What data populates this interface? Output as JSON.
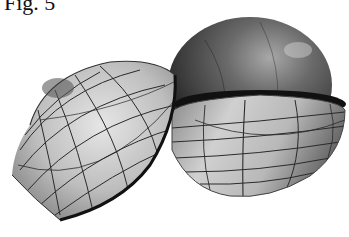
{
  "figure": {
    "label": "Fig. 5",
    "parts": [
      {
        "name": "open-hemisphere-shell",
        "description": "left tilted hemisphere shell with latitude/longitude grid"
      },
      {
        "name": "inner-sphere",
        "description": "dark sphere resting in lower hemisphere cup"
      },
      {
        "name": "lower-hemisphere-cup",
        "description": "right lower hemisphere bowl with grid lines"
      }
    ],
    "colors": {
      "background": "#ffffff",
      "shell_light": "#d8d8d8",
      "shell_mid": "#9a9a9a",
      "sphere_dark": "#3a3a3a",
      "grid_line": "#2a2a2a"
    }
  }
}
